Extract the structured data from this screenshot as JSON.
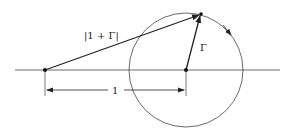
{
  "diagram": {
    "labels": {
      "magnitude": "|1 + Γ|",
      "gamma": "Γ",
      "unit_distance": "1"
    },
    "colors": {
      "stroke": "#222222",
      "background": "#ffffff"
    }
  }
}
